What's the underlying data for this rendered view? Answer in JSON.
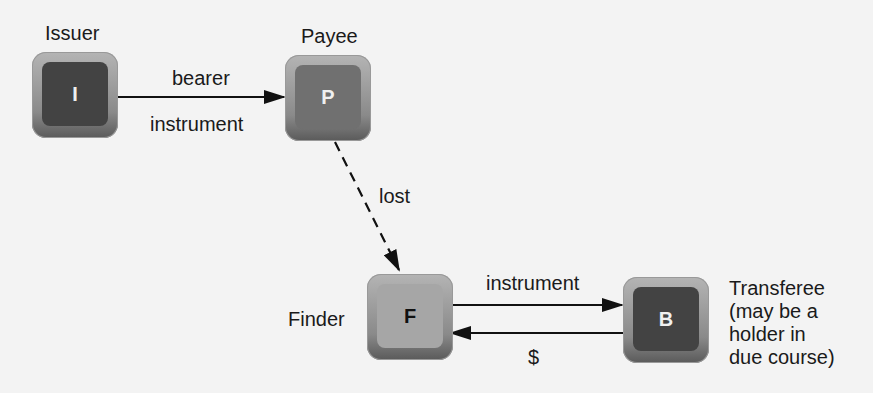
{
  "nodes": {
    "issuer": {
      "letter": "I",
      "label": "Issuer"
    },
    "payee": {
      "letter": "P",
      "label": "Payee"
    },
    "finder": {
      "letter": "F",
      "label": "Finder"
    },
    "transferee": {
      "letter": "B",
      "label_lines": [
        "Transferee",
        "(may be a",
        "holder in",
        "due course)"
      ]
    }
  },
  "edges": {
    "issuer_to_payee": {
      "label_top": "bearer",
      "label_bottom": "instrument"
    },
    "payee_to_finder": {
      "label": "lost",
      "style": "dashed"
    },
    "finder_to_transferee": {
      "label": "instrument"
    },
    "transferee_to_finder": {
      "label": "$"
    }
  }
}
